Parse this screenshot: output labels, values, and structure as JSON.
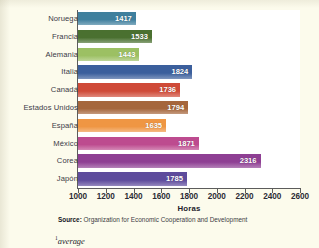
{
  "chart_data": {
    "type": "bar",
    "orientation": "horizontal",
    "title": "",
    "xlabel": "Horas",
    "ylabel": "",
    "xlim": [
      1000,
      2600
    ],
    "xticks": [
      1000,
      1200,
      1400,
      1600,
      1800,
      2000,
      2200,
      2400,
      2600
    ],
    "grid": false,
    "legend": null,
    "categories": [
      "Noruega",
      "Francia",
      "Alemania",
      "Italia",
      "Canadá",
      "Estados Unidos",
      "España",
      "México",
      "Corea",
      "Japón"
    ],
    "values": [
      1417,
      1533,
      1443,
      1824,
      1736,
      1794,
      1635,
      1871,
      2316,
      1785
    ],
    "bar_colors": [
      "#3f7f9e",
      "#4a7030",
      "#9cc063",
      "#3b5f9c",
      "#cf4a38",
      "#a5663c",
      "#ef9643",
      "#bd4b8f",
      "#8e3f93",
      "#5d4b9c"
    ],
    "data_label_color": "#ffffff",
    "plot_background": "#ffffff",
    "page_background": "#fcfbec"
  },
  "chart": {
    "bars": [
      {
        "label": "Noruega",
        "value": 1417,
        "value_text": "1417",
        "color": "#3f7f9e"
      },
      {
        "label": "Francia",
        "value": 1533,
        "value_text": "1533",
        "color": "#4a7030"
      },
      {
        "label": "Alemania",
        "value": 1443,
        "value_text": "1443",
        "color": "#9cc063"
      },
      {
        "label": "Italia",
        "value": 1824,
        "value_text": "1824",
        "color": "#3b5f9c"
      },
      {
        "label": "Canadá",
        "value": 1736,
        "value_text": "1736",
        "color": "#cf4a38"
      },
      {
        "label": "Estados Unidos",
        "value": 1794,
        "value_text": "1794",
        "color": "#a5663c"
      },
      {
        "label": "España",
        "value": 1635,
        "value_text": "1635",
        "color": "#ef9643"
      },
      {
        "label": "México",
        "value": 1871,
        "value_text": "1871",
        "color": "#bd4b8f"
      },
      {
        "label": "Corea",
        "value": 2316,
        "value_text": "2316",
        "color": "#8e3f93"
      },
      {
        "label": "Japón",
        "value": 1785,
        "value_text": "1785",
        "color": "#5d4b9c"
      }
    ],
    "x_axis": {
      "label": "Horas",
      "ticks": [
        "1000",
        "1200",
        "1400",
        "1600",
        "1800",
        "2000",
        "2200",
        "2400",
        "2600"
      ],
      "min": 1000,
      "max": 2600
    }
  },
  "source": {
    "prefix": "Source:",
    "text": "Organization for Economic Cooperation and Development"
  },
  "footnote": {
    "marker": "1",
    "text": "average"
  }
}
